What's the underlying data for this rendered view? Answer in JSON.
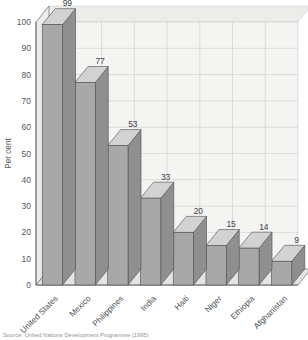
{
  "chart_data": {
    "type": "bar",
    "title": "",
    "xlabel": "",
    "ylabel": "Per cent",
    "ylim": [
      0,
      100
    ],
    "ytick_step": 10,
    "yticks": [
      0,
      10,
      20,
      30,
      40,
      50,
      60,
      70,
      80,
      90,
      100
    ],
    "grid": true,
    "legend": "none",
    "style": "3d-bars-grayscale",
    "categories": [
      "United States",
      "Mexico",
      "Philippines",
      "India",
      "Haiti",
      "Niger",
      "Ethiopia",
      "Afghanistan"
    ],
    "values": [
      99,
      77,
      53,
      33,
      20,
      15,
      14,
      9
    ],
    "value_labels": [
      "99",
      "77",
      "53",
      "33",
      "20",
      "15",
      "14",
      "9"
    ],
    "source": "Source: United Nations Development Programme (1995)"
  },
  "colors": {
    "bar_front": "#a8a8a8",
    "bar_top": "#d2d2d2",
    "bar_side": "#8f8f8f",
    "bar_edge": "#4d4d4d",
    "plot_bg": "#f4f4f2",
    "floor": "#e4e4e2",
    "wall": "#ececeb",
    "grid": "#c9c9c7",
    "axis": "#6e7175",
    "text": "#4a4d51",
    "source_text": "#8d9094"
  },
  "axis": {
    "ylabel": "Per cent",
    "ytick_0": "0",
    "ytick_10": "10",
    "ytick_20": "20",
    "ytick_30": "30",
    "ytick_40": "40",
    "ytick_50": "50",
    "ytick_60": "60",
    "ytick_70": "70",
    "ytick_80": "80",
    "ytick_90": "90",
    "ytick_100": "100"
  },
  "footer": {
    "source": "Source: United Nations Development Programme (1995)"
  }
}
